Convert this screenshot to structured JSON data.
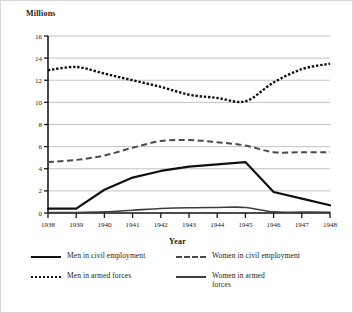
{
  "chart_data": {
    "type": "line",
    "title": "",
    "ylabel": "Millions",
    "xlabel": "Year",
    "x": [
      1938,
      1939,
      1940,
      1941,
      1942,
      1943,
      1944,
      1945,
      1946,
      1947,
      1948
    ],
    "categories": [
      "1938",
      "1939",
      "1940",
      "1941",
      "1942",
      "1943",
      "1944",
      "1945",
      "1946",
      "1947",
      "1948"
    ],
    "ylim": [
      0,
      16
    ],
    "yticks": [
      0,
      2,
      4,
      6,
      8,
      10,
      12,
      14,
      16
    ],
    "ytick_labels": [
      "0",
      "2",
      "4",
      "6",
      "8",
      "10",
      "12",
      "14",
      "16"
    ],
    "grid": true,
    "legend_position": "below",
    "series": [
      {
        "name": "Men in civil employment",
        "style": "solid-thick",
        "color": "#111111",
        "values": [
          0.4,
          0.4,
          2.1,
          3.2,
          3.8,
          4.2,
          4.4,
          4.6,
          1.9,
          1.3,
          0.7
        ]
      },
      {
        "name": "Women in civil employment",
        "style": "dashed",
        "color": "#4a4a4a",
        "values": [
          4.6,
          4.8,
          5.2,
          5.9,
          6.5,
          6.6,
          6.4,
          6.1,
          5.5,
          5.5,
          5.5
        ]
      },
      {
        "name": "Men in armed forces",
        "style": "dotted",
        "color": "#111111",
        "values": [
          12.9,
          13.2,
          12.6,
          12.0,
          11.4,
          10.7,
          10.4,
          10.1,
          11.8,
          13.0,
          13.5
        ]
      },
      {
        "name": "Women in armed forces",
        "style": "solid-thin",
        "color": "#3d3d3d",
        "values": [
          0.05,
          0.05,
          0.1,
          0.25,
          0.4,
          0.48,
          0.5,
          0.5,
          0.1,
          0.08,
          0.07
        ]
      }
    ]
  },
  "legend": {
    "entries": [
      {
        "label": "Men in civil employment",
        "swatch": "line-solid-thick-icon"
      },
      {
        "label": "Women in civil employment",
        "swatch": "line-dashed-icon"
      },
      {
        "label": "Men in armed forces",
        "swatch": "line-dotted-icon"
      },
      {
        "label": "Women in armed forces",
        "swatch": "line-solid-thin-icon"
      }
    ]
  }
}
